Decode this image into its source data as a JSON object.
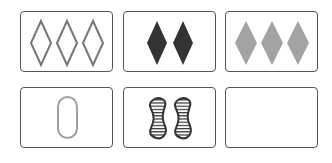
{
  "board": {
    "rows": 2,
    "cols": 3,
    "cards": [
      {
        "index": 0,
        "count": 3,
        "shape": "diamond",
        "fill": "outline",
        "color": "#777777",
        "label": "three outlined diamonds"
      },
      {
        "index": 1,
        "count": 2,
        "shape": "diamond",
        "fill": "solid",
        "color": "#333333",
        "label": "two solid dark diamonds"
      },
      {
        "index": 2,
        "count": 3,
        "shape": "diamond",
        "fill": "solid",
        "color": "#a3a3a3",
        "label": "three solid gray diamonds"
      },
      {
        "index": 3,
        "count": 1,
        "shape": "oval",
        "fill": "outline",
        "color": "#a0a0a0",
        "label": "one outlined oval"
      },
      {
        "index": 4,
        "count": 2,
        "shape": "squiggle",
        "fill": "striped",
        "color": "#333333",
        "label": "two striped squiggles"
      },
      {
        "index": 5,
        "count": 0,
        "shape": "none",
        "fill": "none",
        "color": "#ffffff",
        "label": "empty card"
      }
    ]
  },
  "colors": {
    "card_border": "#555555",
    "background": "#ffffff"
  }
}
